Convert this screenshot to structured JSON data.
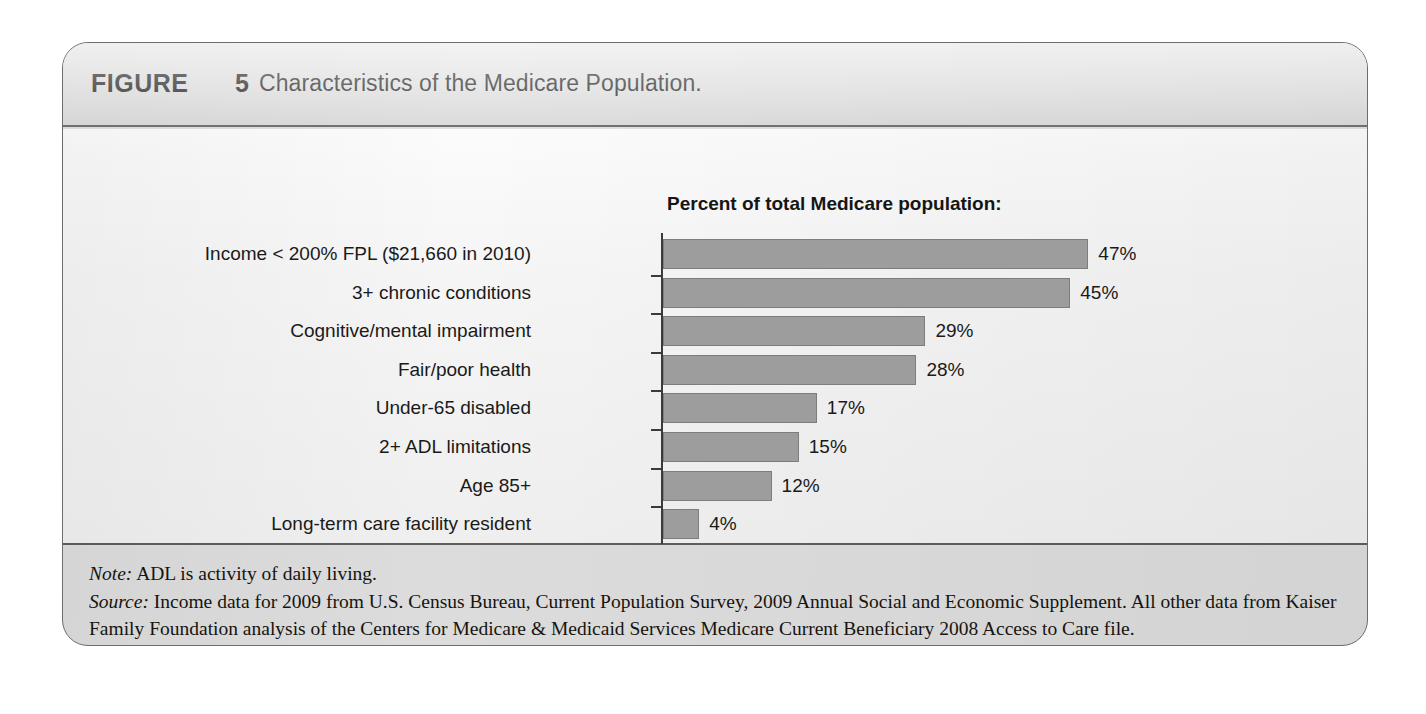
{
  "figure": {
    "label": "FIGURE",
    "number": "5",
    "caption": "Characteristics of the Medicare Population."
  },
  "chart_data": {
    "type": "bar",
    "orientation": "horizontal",
    "title": "Percent of total Medicare population:",
    "xlabel": "",
    "ylabel": "",
    "xlim": [
      0,
      50
    ],
    "grid": false,
    "legend": null,
    "unit": "%",
    "categories": [
      "Income < 200% FPL ($21,660 in 2010)",
      "3+ chronic conditions",
      "Cognitive/mental impairment",
      "Fair/poor health",
      "Under-65 disabled",
      "2+ ADL limitations",
      "Age 85+",
      "Long-term care facility resident"
    ],
    "values": [
      47,
      45,
      29,
      28,
      17,
      15,
      12,
      4
    ],
    "value_labels": [
      "47%",
      "45%",
      "29%",
      "28%",
      "17%",
      "15%",
      "12%",
      "4%"
    ],
    "bar_color": "#9d9d9d",
    "bar_border_color": "#7d7d7d",
    "axis_color": "#3b3b3b"
  },
  "footer": {
    "note_lead": "Note:",
    "note_text": " ADL is activity of daily living.",
    "source_lead": "Source:",
    "source_text": " Income data for 2009 from U.S. Census Bureau, Current Population Survey, 2009 Annual Social and Economic Supplement. All other data from Kaiser Family Foundation analysis of the Centers for Medicare & Medicaid Services Medicare Current Beneficiary 2008 Access to Care file."
  }
}
